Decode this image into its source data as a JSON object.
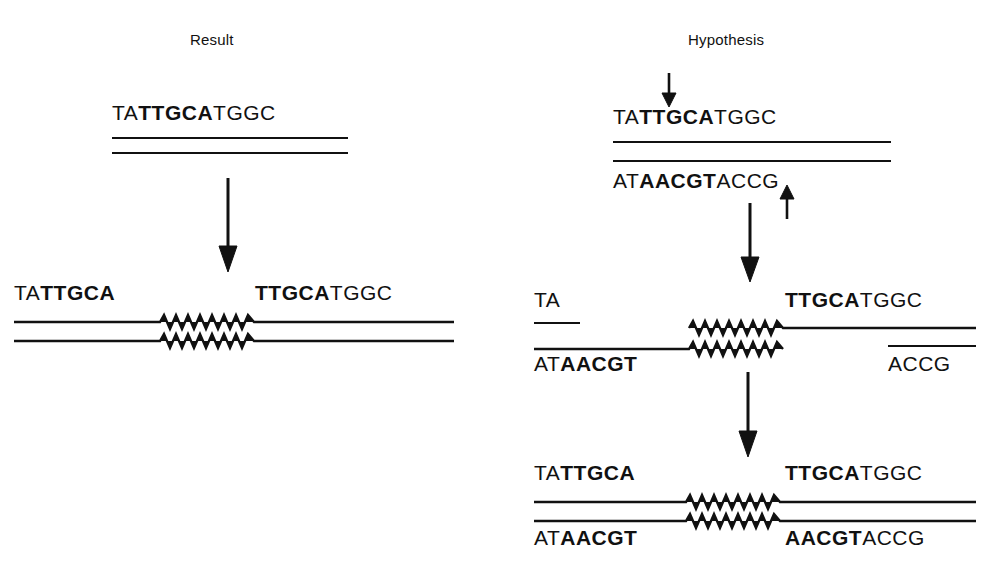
{
  "figure": {
    "type": "diagram",
    "background": "#ffffff",
    "ink_color": "#111111"
  },
  "panels": {
    "left": {
      "title": "Result",
      "stages": [
        {
          "name": "target-duplex",
          "top_strand": [
            {
              "text": "TA",
              "bold": false
            },
            {
              "text": "TTGCA",
              "bold": true
            },
            {
              "text": "TGGC",
              "bold": false
            }
          ],
          "bottom_strand": []
        },
        {
          "name": "duplicated-duplex",
          "top_strand_left": [
            {
              "text": "TA",
              "bold": false
            },
            {
              "text": "TTGCA",
              "bold": true
            }
          ],
          "top_strand_right": [
            {
              "text": "TTGCA",
              "bold": true
            },
            {
              "text": "TGGC",
              "bold": false
            }
          ],
          "bottom_strand_left": [],
          "bottom_strand_right": []
        }
      ]
    },
    "right": {
      "title": "Hypothesis",
      "stages": [
        {
          "name": "staggered-cut-duplex",
          "top_strand": [
            {
              "text": "TA",
              "bold": false
            },
            {
              "text": "TTGCA",
              "bold": true
            },
            {
              "text": "TGGC",
              "bold": false
            }
          ],
          "bottom_strand": [
            {
              "text": "AT",
              "bold": false
            },
            {
              "text": "AACGT",
              "bold": true
            },
            {
              "text": "ACCG",
              "bold": false
            }
          ]
        },
        {
          "name": "strand-transfer-intermediate",
          "top_strand_left": [
            {
              "text": "TA",
              "bold": false
            }
          ],
          "top_strand_right": [
            {
              "text": "TTGCA",
              "bold": true
            },
            {
              "text": "TGGC",
              "bold": false
            }
          ],
          "bottom_strand_left": [
            {
              "text": "AT",
              "bold": false
            },
            {
              "text": "AACGT",
              "bold": true
            }
          ],
          "bottom_strand_right": [
            {
              "text": "ACCG",
              "bold": false
            }
          ]
        },
        {
          "name": "repaired-duplex",
          "top_strand_left": [
            {
              "text": "TA",
              "bold": false
            },
            {
              "text": "TTGCA",
              "bold": true
            }
          ],
          "top_strand_right": [
            {
              "text": "TTGCA",
              "bold": true
            },
            {
              "text": "TGGC",
              "bold": false
            }
          ],
          "bottom_strand_left": [
            {
              "text": "AT",
              "bold": false
            },
            {
              "text": "AACGT",
              "bold": true
            }
          ],
          "bottom_strand_right": [
            {
              "text": "AACGT",
              "bold": true
            },
            {
              "text": "ACCG",
              "bold": false
            }
          ]
        }
      ]
    }
  },
  "arrows": {
    "left_process": {
      "name": "downward-process-arrow",
      "direction": "down"
    },
    "right_process_1": {
      "name": "downward-process-arrow",
      "direction": "down"
    },
    "right_process_2": {
      "name": "downward-process-arrow",
      "direction": "down"
    },
    "top_cut_marker": {
      "name": "cut-site-arrow-top",
      "direction": "down"
    },
    "bottom_cut_marker": {
      "name": "cut-site-arrow-bottom",
      "direction": "up"
    }
  }
}
